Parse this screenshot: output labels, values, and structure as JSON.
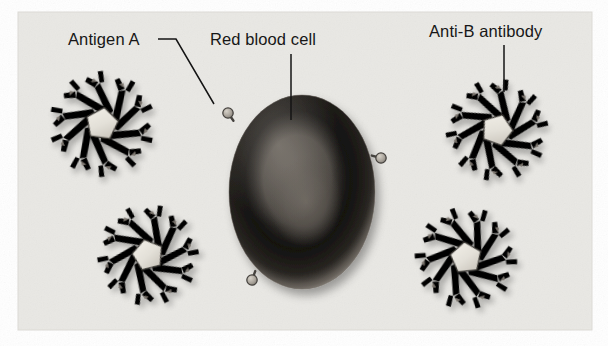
{
  "figure": {
    "kind": "biology-illustration",
    "panel": {
      "background_color": "#e9e8e4",
      "page_color": "#ffffff",
      "x": 18,
      "y": 12,
      "width": 574,
      "height": 318
    }
  },
  "labels": [
    {
      "id": "antigen-a",
      "text": "Antigen A",
      "x": 68,
      "y": 45,
      "anchor": "start",
      "leader_path": "M 158 39 L 176 39 L 214 104",
      "leader_kind": "elbow"
    },
    {
      "id": "red-blood-cell",
      "text": "Red blood cell",
      "x": 210,
      "y": 45,
      "anchor": "start",
      "leader_path": "M 291 54 L 291 120",
      "leader_kind": "straight-vertical"
    },
    {
      "id": "anti-b-antibody",
      "text": "Anti-B antibody",
      "x": 429,
      "y": 37,
      "anchor": "start",
      "leader_path": "M 504 45 L 504 92",
      "leader_kind": "straight-vertical"
    }
  ],
  "red_blood_cell": {
    "name": "red-blood-cell",
    "center_x": 302,
    "center_y": 192,
    "radius_x": 73,
    "radius_y": 97,
    "rim_color": "#3a3733",
    "ring_color": "#242220",
    "center_color": "#55514c",
    "highlight_color": "#8d8881",
    "description": "biconcave disc seen face-on, dark ring with lighter central depression"
  },
  "antigens": [
    {
      "name": "antigen-marker-upper-left",
      "cx": 228,
      "cy": 113,
      "r": 5.2,
      "stalk_angle": 125
    },
    {
      "name": "antigen-marker-right",
      "cx": 381,
      "cy": 158,
      "r": 5.2,
      "stalk_angle": 345
    },
    {
      "name": "antigen-marker-bottom",
      "cx": 252,
      "cy": 280,
      "r": 5.2,
      "stalk_angle": 250
    }
  ],
  "antibodies": [
    {
      "name": "antibody-top-left",
      "cx": 102,
      "cy": 124,
      "scale": 1.0,
      "rotation": 8
    },
    {
      "name": "antibody-bottom-left",
      "cx": 148,
      "cy": 255,
      "scale": 0.96,
      "rotation": -14
    },
    {
      "name": "antibody-top-right",
      "cx": 497,
      "cy": 130,
      "scale": 0.97,
      "rotation": 20
    },
    {
      "name": "antibody-bottom-right",
      "cx": 466,
      "cy": 258,
      "scale": 0.97,
      "rotation": -6
    }
  ],
  "palette": {
    "panel_bg": "#e9e8e4",
    "antibody_core": "#e4e1d9",
    "antibody_arm": "#97918a",
    "antibody_arm_light": "#b8b2a9",
    "antibody_arm_dark": "#6f6a64",
    "antibody_outline": "#3d3a36",
    "antigen_fill": "#b5b0a7",
    "antigen_outline": "#45423e",
    "label_color": "#171717",
    "leader_color": "#141414"
  }
}
